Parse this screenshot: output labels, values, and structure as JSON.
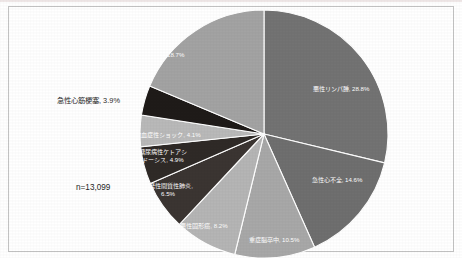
{
  "figure": {
    "sample_size_label": "n=13,099",
    "frame_color": "#c3c3c3",
    "background_color": "#ffffff"
  },
  "chart_data": {
    "type": "pie",
    "title": "",
    "subtitle": "",
    "xlabel": "",
    "ylabel": "",
    "legend_position": "none",
    "grid": false,
    "total_n": 13099,
    "value_unit": "%",
    "start_angle_deg": 0,
    "direction": "clockwise",
    "categories": [
      "悪性リンパ腫",
      "急性心不全",
      "重症脳卒中",
      "悪性固形癌",
      "特発性間質性肺炎",
      "糖尿病性ケトアシドーシス",
      "敗血症性ショック",
      "急性心筋梗塞",
      "その他"
    ],
    "values": [
      28.8,
      14.6,
      10.5,
      8.2,
      6.5,
      4.9,
      4.1,
      3.9,
      18.7
    ],
    "colors": [
      "#737373",
      "#6f6f6f",
      "#a8a8a8",
      "#b5b5b5",
      "#3b3532",
      "#2f2a27",
      "#b9b9b9",
      "#1f1b19",
      "#a3a3a3"
    ],
    "slices": [
      {
        "name": "悪性リンパ腫",
        "value": 28.8,
        "label": "悪性リンパ腫, 28.8%",
        "color": "#737373",
        "label_placement": "inside",
        "label_x": 341,
        "label_y": 91
      },
      {
        "name": "急性心不全",
        "value": 14.6,
        "label": "急性心不全, 14.6%",
        "color": "#6f6f6f",
        "label_placement": "inside",
        "label_x": 337,
        "label_y": 182
      },
      {
        "name": "重症脳卒中",
        "value": 10.5,
        "label": "重症脳卒中, 10.5%",
        "color": "#a8a8a8",
        "label_placement": "inside",
        "label_x": 274,
        "label_y": 242
      },
      {
        "name": "悪性固形癌",
        "value": 8.2,
        "label": "悪性固形癌, 8.2%",
        "color": "#b5b5b5",
        "label_placement": "inside",
        "label_x": 204,
        "label_y": 228
      },
      {
        "name": "特発性間質性肺炎",
        "value": 6.5,
        "label": "特発性間質性肺炎,",
        "label_line2": "6.5%",
        "color": "#3b3532",
        "label_placement": "inside",
        "label_x": 168,
        "label_y": 188
      },
      {
        "name": "糖尿病性ケトアシドーシス",
        "value": 4.9,
        "label": "糖尿病性ケトアシ",
        "label_line2": "ドーシス, 4.9%",
        "color": "#2f2a27",
        "label_placement": "inside",
        "label_x": 163,
        "label_y": 154
      },
      {
        "name": "敗血症性ショック",
        "value": 4.1,
        "label": "敗血症性ショック, 4.1%",
        "color": "#b9b9b9",
        "label_placement": "inside",
        "label_x": 168,
        "label_y": 137
      },
      {
        "name": "急性心筋梗塞",
        "value": 3.9,
        "label": "急性心筋梗塞, 3.9%",
        "color": "#1f1b19",
        "label_placement": "outside",
        "label_x": 57,
        "label_y": 103
      },
      {
        "name": "その他",
        "value": 18.7,
        "label": "その他, 18.7%",
        "color": "#a3a3a3",
        "label_placement": "inside",
        "label_x": 165,
        "label_y": 57
      }
    ]
  }
}
